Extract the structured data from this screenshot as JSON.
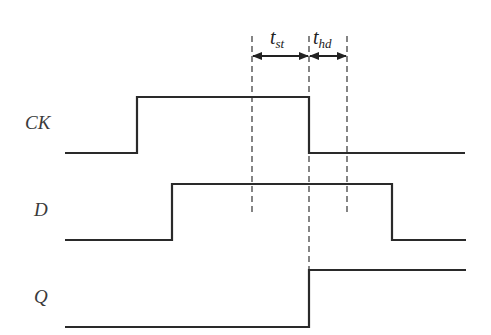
{
  "diagram": {
    "type": "timing",
    "signals": [
      {
        "name": "CK",
        "label": "CK",
        "high_y": 97,
        "low_y": 153,
        "start_x": 65,
        "end_x": 465,
        "edges": [
          {
            "x": 137,
            "dir": "rise"
          },
          {
            "x": 309,
            "dir": "fall"
          }
        ],
        "initial": "low"
      },
      {
        "name": "D",
        "label": "D",
        "high_y": 184,
        "low_y": 240,
        "start_x": 65,
        "end_x": 466,
        "edges": [
          {
            "x": 172,
            "dir": "rise"
          },
          {
            "x": 392,
            "dir": "fall"
          }
        ],
        "initial": "low"
      },
      {
        "name": "Q",
        "label": "Q",
        "high_y": 270,
        "low_y": 327,
        "start_x": 65,
        "end_x": 466,
        "edges": [
          {
            "x": 309,
            "dir": "rise"
          }
        ],
        "initial": "low"
      }
    ],
    "markers": [
      {
        "x": 252,
        "y1": 36,
        "y2": 212
      },
      {
        "x": 309,
        "y1": 36,
        "y2": 270
      },
      {
        "x": 347,
        "y1": 36,
        "y2": 212
      }
    ],
    "intervals": [
      {
        "name": "setup-time",
        "label_main": "t",
        "label_sub": "st",
        "x1": 252,
        "x2": 309,
        "y": 56
      },
      {
        "name": "hold-time",
        "label_main": "t",
        "label_sub": "hd",
        "x1": 309,
        "x2": 347,
        "y": 56
      }
    ],
    "colors": {
      "line": "#2a2a2a",
      "dashed": "#444444"
    }
  }
}
